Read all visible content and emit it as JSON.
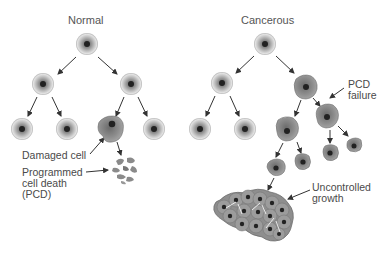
{
  "titles": {
    "normal": "Normal",
    "cancerous": "Cancerous"
  },
  "labels": {
    "damaged_cell": "Damaged cell",
    "pcd_line1": "Programmed",
    "pcd_line2": "cell death",
    "pcd_line3": "(PCD)",
    "pcd_failure_line1": "PCD",
    "pcd_failure_line2": "failure",
    "uncontrolled_line1": "Uncontrolled",
    "uncontrolled_line2": "growth"
  },
  "colors": {
    "normal_cell_outer": "#c8c8c8",
    "normal_cell_inner": "#8e8e8e",
    "nucleus": "#222222",
    "cancer_cell": "#8a8a8a",
    "cancer_cell_edge": "#6e6e6e",
    "arrow": "#333333",
    "text": "#4a4a4a"
  }
}
